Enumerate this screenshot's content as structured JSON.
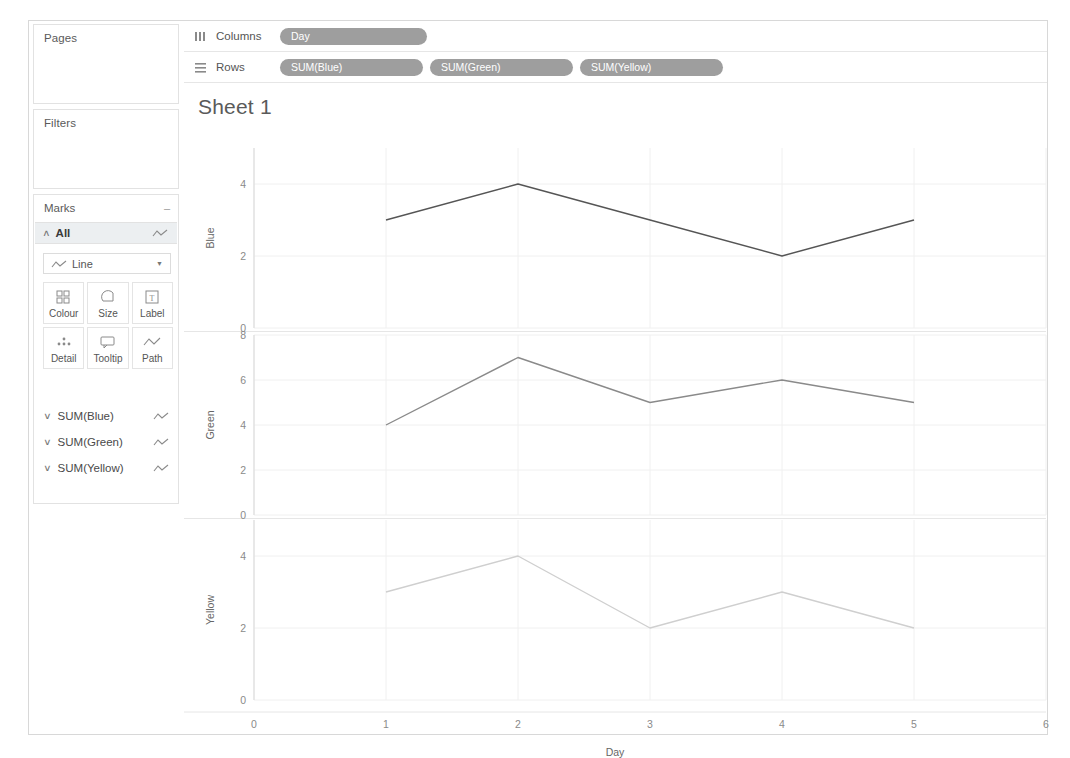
{
  "sidebar": {
    "pages": {
      "title": "Pages"
    },
    "filters": {
      "title": "Filters"
    },
    "marks": {
      "title": "Marks",
      "collapse_glyph": "–",
      "all_label": "All",
      "mark_type": "Line",
      "caret_glyph": "▼",
      "chevron_up": "∧",
      "chevron_down": "∨",
      "buttons": [
        {
          "label": "Colour",
          "icon": "colour-icon"
        },
        {
          "label": "Size",
          "icon": "size-icon"
        },
        {
          "label": "Label",
          "icon": "label-icon"
        },
        {
          "label": "Detail",
          "icon": "detail-icon"
        },
        {
          "label": "Tooltip",
          "icon": "tooltip-icon"
        },
        {
          "label": "Path",
          "icon": "path-icon"
        }
      ],
      "measures": [
        {
          "label": "SUM(Blue)"
        },
        {
          "label": "SUM(Green)"
        },
        {
          "label": "SUM(Yellow)"
        }
      ]
    }
  },
  "shelves": {
    "columns": {
      "name": "Columns",
      "icon": "columns-icon",
      "pills": [
        {
          "label": "Day"
        }
      ]
    },
    "rows": {
      "name": "Rows",
      "icon": "rows-icon",
      "pills": [
        {
          "label": "SUM(Blue)"
        },
        {
          "label": "SUM(Green)"
        },
        {
          "label": "SUM(Yellow)"
        }
      ]
    }
  },
  "view": {
    "title": "Sheet 1"
  },
  "colors": {
    "blue_line": "#555555",
    "green_line": "#8a8a8a",
    "yellow_line": "#cfcfcf",
    "pill": "#9e9e9e",
    "gridline": "#f0f0f0",
    "axis": "#d9d9d9"
  },
  "chart_data": {
    "type": "line",
    "title": "Sheet 1",
    "xlabel": "Day",
    "x": [
      1,
      2,
      3,
      4,
      5
    ],
    "xlim": [
      0,
      6
    ],
    "xticks": [
      0,
      1,
      2,
      3,
      4,
      5,
      6
    ],
    "grid": true,
    "legend": "none",
    "panes": [
      {
        "ylabel": "Blue",
        "field": "SUM(Blue)",
        "ylim": [
          0,
          5
        ],
        "yticks": [
          0,
          2,
          4
        ],
        "values": [
          3,
          4,
          3,
          2,
          3
        ],
        "color": "#555555"
      },
      {
        "ylabel": "Green",
        "field": "SUM(Green)",
        "ylim": [
          0,
          8
        ],
        "yticks": [
          0,
          2,
          4,
          6,
          8
        ],
        "values": [
          4,
          7,
          5,
          6,
          5
        ],
        "color": "#8a8a8a"
      },
      {
        "ylabel": "Yellow",
        "field": "SUM(Yellow)",
        "ylim": [
          0,
          5
        ],
        "yticks": [
          0,
          2,
          4
        ],
        "values": [
          3,
          4,
          2,
          3,
          2
        ],
        "color": "#cfcfcf"
      }
    ]
  }
}
